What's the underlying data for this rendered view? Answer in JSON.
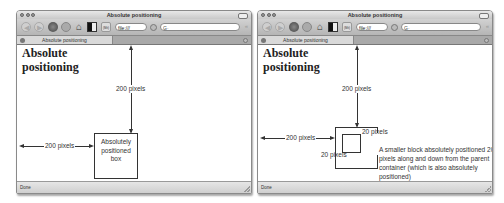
{
  "windows": [
    {
      "id": "left",
      "title": "Absolute positioning",
      "toolbar": {
        "back_icon": "back-arrow-icon",
        "forward_icon": "forward-arrow-icon",
        "reload_icon": "reload-icon",
        "stop_icon": "stop-icon",
        "home_icon": "home-icon",
        "bookmark_icon": "bookmark-icon",
        "history_icon": "history-icon",
        "history_label": "(Mit)",
        "url": "file:///",
        "search_placeholder": "G·"
      },
      "tab": {
        "label": "Absolute positioning"
      },
      "content": {
        "heading_line1": "Absolute",
        "heading_line2": "positioning",
        "top_label": "200 pixels",
        "left_label": "200 pixels",
        "box_text_line1": "Absolutely",
        "box_text_line2": "positioned",
        "box_text_line3": "box"
      },
      "status": "Done"
    },
    {
      "id": "right",
      "title": "Absolute positioning",
      "toolbar": {
        "back_icon": "back-arrow-icon",
        "forward_icon": "forward-arrow-icon",
        "reload_icon": "reload-icon",
        "stop_icon": "stop-icon",
        "home_icon": "home-icon",
        "bookmark_icon": "bookmark-icon",
        "history_icon": "history-icon",
        "history_label": "(Mit)",
        "url": "file:///",
        "search_placeholder": "G·"
      },
      "tab": {
        "label": "Absolute positioning"
      },
      "content": {
        "heading_line1": "Absolute",
        "heading_line2": "positioning",
        "top_label": "200 pixels",
        "left_label": "200 pixels",
        "inner_top_label": "20 pixels",
        "inner_left_label": "20 pixels",
        "description": "A smaller block absolutely positioned 20 pixels along and down from the parent container (which is also absolutely positioned)"
      },
      "status": "Done"
    }
  ]
}
